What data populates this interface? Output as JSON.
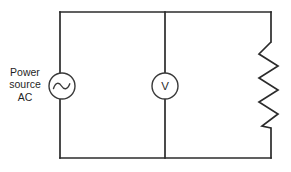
{
  "diagram": {
    "background_color": "#ffffff",
    "line_color": "#2b2b2b",
    "component_color": "#3a3a3a",
    "text_color": "#1f1f1f"
  },
  "labels": {
    "source_line_1": "Power",
    "source_line_2": "source",
    "source_line_3": "AC",
    "voltmeter_symbol": "V"
  },
  "components": [
    {
      "id": "ac-source",
      "type": "ac-voltage-source",
      "symbol": "circle-with-sine-wave",
      "label": "Power source AC",
      "branch": "left",
      "center_x": 62,
      "center_y": 86,
      "radius": 13
    },
    {
      "id": "voltmeter",
      "type": "voltmeter",
      "symbol": "circle-with-letter-V",
      "label": "V",
      "branch": "middle",
      "center_x": 165,
      "center_y": 86,
      "radius": 13
    },
    {
      "id": "resistor",
      "type": "resistor",
      "symbol": "zigzag",
      "label": "",
      "branch": "right",
      "x": 271,
      "y_top": 42,
      "y_bottom": 128,
      "peaks": 7
    }
  ],
  "wires": {
    "outer_rect": {
      "left": 60,
      "top": 12,
      "right": 271,
      "bottom": 158
    },
    "middle_branch_x": 165
  }
}
